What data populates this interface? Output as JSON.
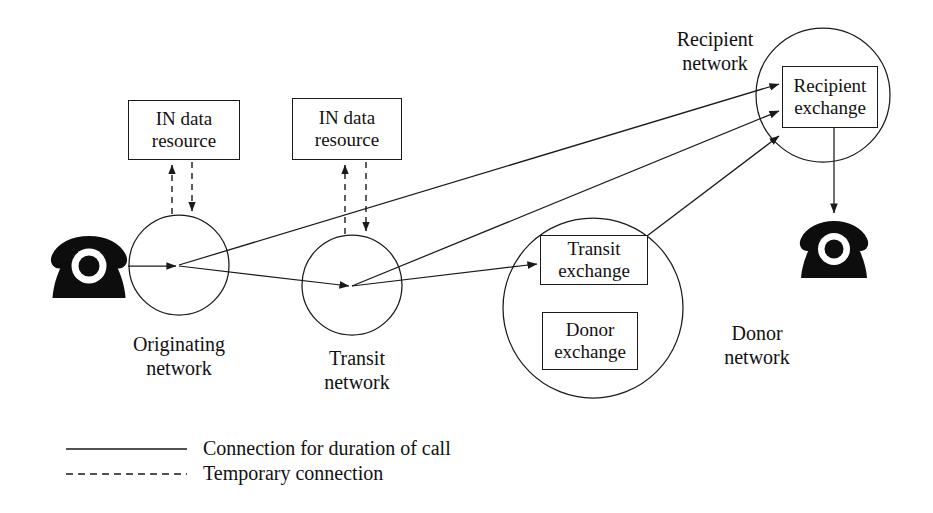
{
  "diagram": {
    "colors": {
      "stroke": "#1a1a1a",
      "fill": "#ffffff",
      "phone": "#0d0d0d"
    },
    "networks": [
      {
        "id": "originating",
        "label": "Originating\nnetwork",
        "shape": "circle"
      },
      {
        "id": "transit",
        "label": "Transit\nnetwork",
        "shape": "circle"
      },
      {
        "id": "donor",
        "label": "Donor\nnetwork",
        "shape": "circle"
      },
      {
        "id": "recipient",
        "label": "Recipient\nnetwork",
        "shape": "circle"
      }
    ],
    "nodes": [
      {
        "id": "in-data-resource-1",
        "label": "IN data\nresource",
        "shape": "rect"
      },
      {
        "id": "in-data-resource-2",
        "label": "IN data\nresource",
        "shape": "rect"
      },
      {
        "id": "transit-exchange",
        "label": "Transit\nexchange",
        "shape": "rect"
      },
      {
        "id": "donor-exchange",
        "label": "Donor\nexchange",
        "shape": "rect"
      },
      {
        "id": "recipient-exchange",
        "label": "Recipient\nexchange",
        "shape": "rect"
      }
    ],
    "endpoints": [
      {
        "id": "calling-phone",
        "icon": "telephone-icon"
      },
      {
        "id": "called-phone",
        "icon": "telephone-icon"
      }
    ],
    "connections": [
      {
        "from": "calling-phone",
        "to": "originating",
        "style": "solid"
      },
      {
        "from": "originating",
        "to": "transit",
        "style": "solid"
      },
      {
        "from": "originating",
        "to": "recipient-exchange",
        "style": "solid"
      },
      {
        "from": "transit",
        "to": "transit-exchange",
        "style": "solid"
      },
      {
        "from": "transit",
        "to": "recipient-exchange",
        "style": "solid"
      },
      {
        "from": "transit-exchange",
        "to": "recipient-exchange",
        "style": "solid"
      },
      {
        "from": "recipient-exchange",
        "to": "called-phone",
        "style": "solid"
      },
      {
        "from": "originating",
        "to": "in-data-resource-1",
        "style": "dashed"
      },
      {
        "from": "in-data-resource-1",
        "to": "originating",
        "style": "dashed"
      },
      {
        "from": "transit",
        "to": "in-data-resource-2",
        "style": "dashed"
      },
      {
        "from": "in-data-resource-2",
        "to": "transit",
        "style": "dashed"
      }
    ]
  },
  "labels": {
    "in_data_resource_1": "IN data\nresource",
    "in_data_resource_2": "IN data\nresource",
    "transit_exchange": "Transit\nexchange",
    "donor_exchange": "Donor\nexchange",
    "recipient_exchange": "Recipient\nexchange",
    "originating_network": "Originating\nnetwork",
    "transit_network": "Transit\nnetwork",
    "donor_network": "Donor\nnetwork",
    "recipient_network": "Recipient\nnetwork"
  },
  "legend": {
    "items": [
      {
        "style": "solid",
        "label": "Connection for duration of call"
      },
      {
        "style": "dashed",
        "label": "Temporary connection"
      }
    ]
  }
}
